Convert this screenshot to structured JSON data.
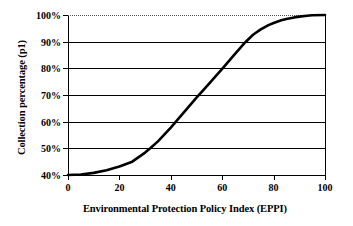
{
  "chart_data": {
    "type": "line",
    "title": "",
    "xlabel": "Environmental Protection Policy Index (EPPI)",
    "ylabel": "Collection percentage (p1)",
    "xlim": [
      0,
      100
    ],
    "ylim": [
      40,
      100
    ],
    "xticks": [
      0,
      20,
      40,
      60,
      80,
      100
    ],
    "xtick_labels": [
      "0",
      "20",
      "40",
      "60",
      "80",
      "100"
    ],
    "yticks": [
      40,
      50,
      60,
      70,
      80,
      90,
      100
    ],
    "ytick_labels": [
      "40%",
      "50%",
      "60%",
      "70%",
      "80%",
      "90%",
      "100%"
    ],
    "grid": "horizontal",
    "grid_solid_levels": [
      50,
      60,
      70,
      80,
      90
    ],
    "grid_faint_levels": [
      100
    ],
    "legend": "none",
    "series": [
      {
        "name": "Collection percentage",
        "color": "#000000",
        "line_width": 2.6,
        "x": [
          0,
          5,
          10,
          15,
          20,
          25,
          30,
          32,
          35,
          40,
          42,
          45,
          50,
          53,
          55,
          58,
          60,
          63,
          65,
          69,
          72,
          75,
          78,
          80,
          83,
          85,
          88,
          90,
          93,
          95,
          100
        ],
        "y": [
          40.0,
          40.2,
          40.8,
          41.8,
          43.2,
          45.0,
          48.4,
          50.0,
          52.6,
          57.8,
          60.0,
          63.4,
          69.0,
          72.2,
          74.4,
          77.6,
          79.8,
          83.2,
          85.4,
          89.8,
          92.6,
          94.6,
          96.2,
          97.0,
          98.0,
          98.5,
          99.1,
          99.4,
          99.7,
          99.9,
          100.0
        ]
      }
    ],
    "annotations": []
  }
}
